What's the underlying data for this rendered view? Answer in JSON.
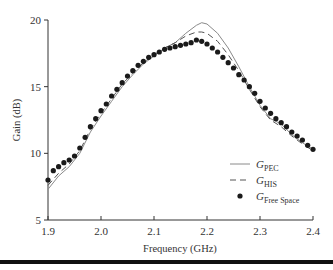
{
  "chart_data": {
    "type": "line",
    "title": "",
    "xlabel": "Frequency (GHz)",
    "ylabel": "Gain (dB)",
    "xlim": [
      1.9,
      2.4
    ],
    "ylim": [
      5,
      20
    ],
    "xticks": [
      "1.9",
      "2.0",
      "2.1",
      "2.2",
      "2.3",
      "2.4"
    ],
    "yticks": [
      "5",
      "10",
      "15",
      "20"
    ],
    "grid": false,
    "legend_position": "lower right",
    "series": [
      {
        "name": "G_PEC",
        "style": "solid",
        "x": [
          1.9,
          1.92,
          1.94,
          1.96,
          1.98,
          2.0,
          2.02,
          2.04,
          2.06,
          2.08,
          2.1,
          2.12,
          2.14,
          2.16,
          2.18,
          2.19,
          2.2,
          2.22,
          2.24,
          2.26,
          2.28,
          2.3,
          2.32,
          2.34,
          2.36,
          2.38,
          2.4
        ],
        "values": [
          7.3,
          8.3,
          9.0,
          10.0,
          11.6,
          12.8,
          13.9,
          15.0,
          15.9,
          16.7,
          17.3,
          17.9,
          18.3,
          19.0,
          19.6,
          19.8,
          19.7,
          19.0,
          17.9,
          16.5,
          15.0,
          13.6,
          12.6,
          12.2,
          11.4,
          10.8,
          10.3
        ]
      },
      {
        "name": "G_HIS",
        "style": "dashed",
        "x": [
          1.9,
          1.92,
          1.94,
          1.96,
          1.98,
          2.0,
          2.02,
          2.04,
          2.06,
          2.08,
          2.1,
          2.12,
          2.14,
          2.16,
          2.18,
          2.19,
          2.2,
          2.22,
          2.24,
          2.26,
          2.28,
          2.3,
          2.32,
          2.34,
          2.36,
          2.38,
          2.4
        ],
        "values": [
          7.6,
          8.5,
          9.2,
          10.2,
          11.8,
          13.0,
          14.1,
          15.2,
          16.0,
          16.8,
          17.4,
          17.9,
          18.3,
          18.8,
          19.1,
          19.1,
          19.0,
          18.4,
          17.4,
          16.2,
          14.8,
          13.5,
          12.5,
          12.0,
          11.3,
          10.7,
          10.2
        ]
      },
      {
        "name": "G_Free Space",
        "style": "markers",
        "x": [
          1.9,
          1.91,
          1.92,
          1.93,
          1.94,
          1.95,
          1.96,
          1.97,
          1.98,
          1.99,
          2.0,
          2.01,
          2.02,
          2.03,
          2.04,
          2.05,
          2.06,
          2.07,
          2.08,
          2.09,
          2.1,
          2.11,
          2.12,
          2.13,
          2.14,
          2.15,
          2.16,
          2.17,
          2.18,
          2.19,
          2.2,
          2.21,
          2.22,
          2.23,
          2.24,
          2.25,
          2.26,
          2.27,
          2.28,
          2.29,
          2.3,
          2.31,
          2.32,
          2.33,
          2.34,
          2.35,
          2.36,
          2.37,
          2.38,
          2.39,
          2.4
        ],
        "values": [
          8.0,
          8.7,
          9.0,
          9.3,
          9.5,
          9.8,
          10.4,
          11.2,
          12.0,
          12.6,
          13.2,
          13.7,
          14.3,
          14.8,
          15.3,
          15.8,
          16.2,
          16.6,
          16.9,
          17.2,
          17.4,
          17.6,
          17.8,
          17.9,
          18.0,
          18.1,
          18.2,
          18.3,
          18.5,
          18.4,
          18.2,
          17.9,
          17.6,
          17.2,
          16.8,
          16.4,
          15.9,
          15.5,
          15.0,
          14.5,
          13.9,
          13.4,
          13.0,
          12.6,
          12.3,
          12.0,
          11.6,
          11.3,
          11.0,
          10.6,
          10.3
        ]
      }
    ]
  },
  "legend": {
    "pec_main": "G",
    "pec_sub": "PEC",
    "his_main": "G",
    "his_sub": "HIS",
    "fs_main": "G",
    "fs_sub": "Free Space"
  },
  "colors": {
    "pec": "#8a8a8a",
    "his": "#555555",
    "fs": "#1a1a1a",
    "axis": "#333333"
  }
}
